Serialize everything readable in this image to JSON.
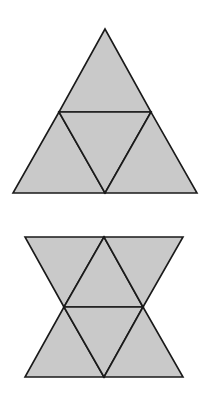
{
  "colors": {
    "background": "#ffffff",
    "fill": "#c9c9c9",
    "stroke": "#1a1a1a"
  },
  "figures": [
    {
      "id": "figure-top",
      "description": "Equilateral triangle subdivided into four smaller triangles (tetrahedron net)",
      "faces": [
        {
          "id": "top",
          "points": "105,29 59,112 151,112"
        },
        {
          "id": "left",
          "points": "59,112 13,193 105,193"
        },
        {
          "id": "center",
          "points": "59,112 151,112 105,193"
        },
        {
          "id": "right",
          "points": "151,112 105,193 197,193"
        }
      ]
    },
    {
      "id": "figure-bottom",
      "description": "Hourglass shape made of six triangles (bowtie net)",
      "faces": [
        {
          "id": "upper-left",
          "points": "25,237 104,237 64,307"
        },
        {
          "id": "upper-center",
          "points": "104,237 64,307 143,307"
        },
        {
          "id": "upper-right",
          "points": "104,237 183,237 143,307"
        },
        {
          "id": "lower-left",
          "points": "64,307 104,377 25,377"
        },
        {
          "id": "lower-center",
          "points": "64,307 143,307 104,377"
        },
        {
          "id": "lower-right",
          "points": "143,307 183,377 104,377"
        }
      ]
    }
  ]
}
